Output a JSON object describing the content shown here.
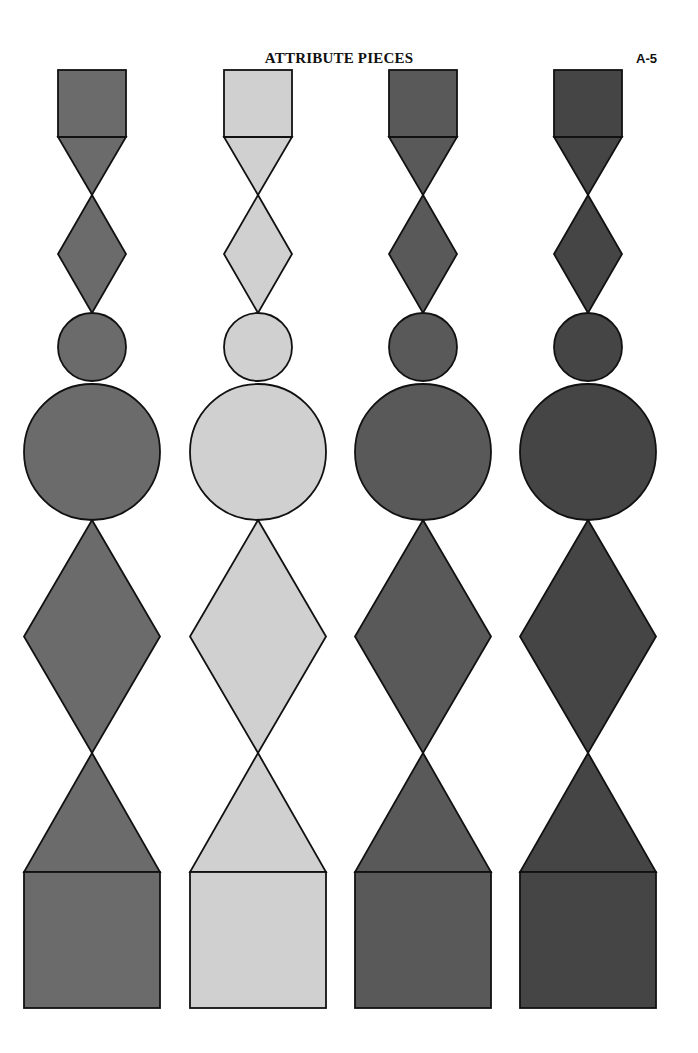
{
  "header": {
    "title": "ATTRIBUTE PIECES",
    "page_number": "A-5"
  },
  "stroke_color": "#111111",
  "geometry": {
    "small_half": 34,
    "big_half": 68,
    "small_square": {
      "top": 70,
      "bottom": 137
    },
    "small_triangle": {
      "top": 137,
      "bottom": 195
    },
    "small_diamond": {
      "top": 195,
      "bottom": 313
    },
    "small_circle": {
      "cy": 347,
      "r": 34
    },
    "big_circle": {
      "cy": 452,
      "r": 68
    },
    "big_diamond": {
      "top": 520,
      "bottom": 753
    },
    "big_triangle": {
      "top": 753,
      "bottom": 872
    },
    "big_square": {
      "top": 872,
      "bottom": 1008
    }
  },
  "columns": [
    {
      "id": "medium-gray",
      "cx": 92,
      "fill": "#6b6b6b"
    },
    {
      "id": "light-gray",
      "cx": 258,
      "fill": "#d0d0d0"
    },
    {
      "id": "dark-gray",
      "cx": 423,
      "fill": "#595959"
    },
    {
      "id": "darkest-gray",
      "cx": 588,
      "fill": "#454545"
    }
  ],
  "pieces_per_column": [
    "small-square",
    "small-triangle",
    "small-diamond",
    "small-circle",
    "big-circle",
    "big-diamond",
    "big-triangle",
    "big-square"
  ]
}
